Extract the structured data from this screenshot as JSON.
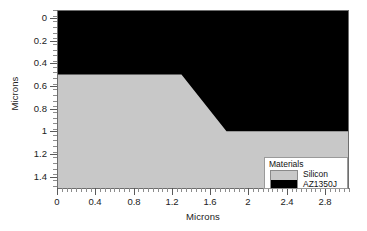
{
  "chart_data": {
    "type": "area",
    "title": "",
    "xlabel": "Microns",
    "ylabel": "Microns",
    "xlim": [
      0,
      3.05
    ],
    "ylim": [
      1.5,
      -0.07
    ],
    "y_inverted": true,
    "grid": false,
    "xticks": [
      "0",
      "0.4",
      "0.8",
      "1.2",
      "1.6",
      "2",
      "2.4",
      "2.8"
    ],
    "xtick_values": [
      0,
      0.4,
      0.8,
      1.2,
      1.6,
      2,
      2.4,
      2.8
    ],
    "yticks": [
      "0",
      "0.2",
      "0.4",
      "0.6",
      "0.8",
      "1",
      "1.2",
      "1.4"
    ],
    "ytick_values": [
      0,
      0.2,
      0.4,
      0.6,
      0.8,
      1,
      1.2,
      1.4
    ],
    "x_minor_interval": 0.05,
    "y_minor_interval": 0.05,
    "series": [
      {
        "name": "AZ1350J",
        "color": "#000000",
        "region": "resist",
        "boundary_x": [
          0,
          1.3,
          1.77,
          3.05
        ],
        "boundary_y": [
          0.5,
          0.5,
          1.0,
          1.0
        ],
        "description": "Photoresist layer occupying the top of the profile; its lower interface steps from 0.5 microns down to 1.0 microns between x=1.3 and x=1.77 microns."
      },
      {
        "name": "Silicon",
        "color": "#c8c8c8",
        "region": "substrate",
        "top_x": [
          0,
          1.3,
          1.77,
          3.05
        ],
        "top_y": [
          0.5,
          0.5,
          1.0,
          1.0
        ],
        "bottom_y": 1.5,
        "description": "Silicon substrate filling the lower portion of the plot beneath the resist interface."
      }
    ],
    "legend": {
      "position": "lower right",
      "title": "Materials",
      "entries": [
        {
          "label": "Silicon",
          "color": "#c8c8c8"
        },
        {
          "label": "AZ1350J",
          "color": "#000000"
        }
      ]
    },
    "colors": {
      "silicon": "#c8c8c8",
      "az1350j": "#000000",
      "background": "#ffffff",
      "axis": "#6e6e6e",
      "text": "#222222"
    }
  }
}
